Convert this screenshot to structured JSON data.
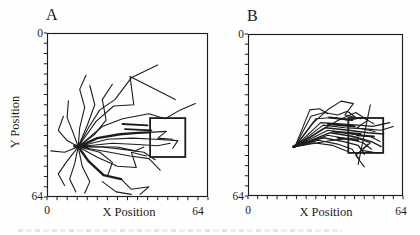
{
  "colors": {
    "ink": "#1c1c1c",
    "paper": "#fefefe"
  },
  "chart_data": [
    {
      "type": "line",
      "panel_label": "A",
      "xlabel": "X Position",
      "ylabel": "Y Position",
      "xlim": [
        0,
        64
      ],
      "ylim": [
        0,
        64
      ],
      "y_axis_inverted_downward": true,
      "tick_step": 4,
      "tick_labels_x": [
        "0",
        "64"
      ],
      "tick_labels_y": [
        "0",
        "64"
      ],
      "grid": false,
      "platform_square": {
        "x": 41,
        "y": 33.2,
        "w": 14,
        "h": 15.2
      },
      "hub_point": [
        12.4,
        44.4
      ],
      "trajectories": [
        {
          "pts": [
            [
              12.4,
              44.4
            ],
            [
              16.5,
              37
            ],
            [
              21,
              30
            ],
            [
              27,
              26
            ],
            [
              33.5,
              17.5
            ],
            [
              44,
              12.5
            ]
          ]
        },
        {
          "pts": [
            [
              12.4,
              44.4
            ],
            [
              19.5,
              34.5
            ],
            [
              26.5,
              28.5
            ],
            [
              34.5,
              28
            ],
            [
              33,
              17
            ],
            [
              51,
              26
            ]
          ]
        },
        {
          "pts": [
            [
              12.4,
              44.4
            ],
            [
              22,
              36.5
            ],
            [
              30,
              33.5
            ],
            [
              40.5,
              31.5
            ],
            [
              47,
              33.5
            ],
            [
              53,
              30
            ],
            [
              59,
              27.5
            ]
          ]
        },
        {
          "w": 2.4,
          "pts": [
            [
              12.4,
              44.4
            ],
            [
              20,
              41
            ],
            [
              29,
              39.5
            ],
            [
              36,
              39
            ],
            [
              40.5,
              38.8
            ]
          ]
        },
        {
          "pts": [
            [
              40.5,
              38.8
            ],
            [
              47.5,
              38.4
            ],
            [
              44,
              41
            ],
            [
              50,
              41.5
            ]
          ]
        },
        {
          "w": 1.8,
          "pts": [
            [
              30,
              35.5
            ],
            [
              40,
              36
            ]
          ]
        },
        {
          "w": 1.8,
          "pts": [
            [
              31,
              37.5
            ],
            [
              41.5,
              38
            ]
          ]
        },
        {
          "pts": [
            [
              12.4,
              44.4
            ],
            [
              24,
              41.5
            ],
            [
              34,
              41
            ],
            [
              43,
              41.5
            ],
            [
              52,
              42
            ],
            [
              50,
              45
            ]
          ]
        },
        {
          "pts": [
            [
              12.4,
              44.4
            ],
            [
              26,
              43
            ],
            [
              36,
              43.5
            ],
            [
              44,
              44
            ],
            [
              49,
              43
            ]
          ]
        },
        {
          "pts": [
            [
              12.4,
              44.4
            ],
            [
              28,
              44.5
            ],
            [
              35,
              46
            ],
            [
              38.5,
              44.5
            ]
          ]
        },
        {
          "pts": [
            [
              12.4,
              44.4
            ],
            [
              22,
              44.5
            ],
            [
              31,
              45.5
            ],
            [
              38.5,
              46.5
            ],
            [
              43,
              49.5
            ]
          ]
        },
        {
          "pts": [
            [
              12.4,
              44.4
            ],
            [
              25,
              46.5
            ],
            [
              33,
              48
            ],
            [
              40.5,
              49
            ],
            [
              45,
              53.5
            ]
          ]
        },
        {
          "pts": [
            [
              12.4,
              44.4
            ],
            [
              20,
              48.5
            ],
            [
              28,
              52
            ],
            [
              35.5,
              52.5
            ],
            [
              33.5,
              46.5
            ],
            [
              39.5,
              48
            ]
          ]
        },
        {
          "w": 2.4,
          "pts": [
            [
              12.4,
              44.4
            ],
            [
              16.5,
              50
            ],
            [
              22.5,
              55.5
            ],
            [
              29.5,
              57
            ]
          ]
        },
        {
          "pts": [
            [
              29.5,
              57
            ],
            [
              33.5,
              61
            ],
            [
              40.5,
              60
            ],
            [
              37,
              63
            ]
          ]
        },
        {
          "pts": [
            [
              12.4,
              44.4
            ],
            [
              14,
              52
            ],
            [
              17,
              58
            ],
            [
              15,
              62.5
            ]
          ]
        },
        {
          "pts": [
            [
              12.4,
              44.4
            ],
            [
              11,
              51
            ],
            [
              9,
              57
            ],
            [
              11.5,
              62
            ]
          ]
        },
        {
          "pts": [
            [
              12.4,
              44.4
            ],
            [
              8,
              50
            ],
            [
              4.5,
              55
            ],
            [
              7,
              59.5
            ]
          ]
        },
        {
          "pts": [
            [
              12.4,
              44.4
            ],
            [
              7,
              46.5
            ],
            [
              1.5,
              46
            ]
          ]
        },
        {
          "pts": [
            [
              12.4,
              44.4
            ],
            [
              8,
              42
            ],
            [
              4.5,
              38
            ],
            [
              6.5,
              32.5
            ]
          ]
        },
        {
          "pts": [
            [
              12.4,
              44.4
            ],
            [
              10,
              38
            ],
            [
              8,
              33
            ],
            [
              8.5,
              26.5
            ]
          ]
        },
        {
          "pts": [
            [
              12.4,
              44.4
            ],
            [
              13,
              37
            ],
            [
              15,
              29
            ],
            [
              13,
              22
            ],
            [
              15.5,
              16.5
            ]
          ]
        },
        {
          "pts": [
            [
              12.4,
              44.4
            ],
            [
              16,
              36
            ],
            [
              19,
              28
            ],
            [
              17,
              20.5
            ]
          ]
        },
        {
          "pts": [
            [
              12.4,
              44.4
            ],
            [
              19,
              39.5
            ],
            [
              23.5,
              34
            ],
            [
              22,
              26
            ],
            [
              26,
              20
            ]
          ]
        },
        {
          "pts": [
            [
              12.4,
              44.4
            ],
            [
              21,
              46.5
            ],
            [
              26,
              50.5
            ],
            [
              24,
              56
            ]
          ]
        },
        {
          "pts": [
            [
              22,
              58
            ],
            [
              27.5,
              62
            ],
            [
              33.5,
              63
            ]
          ]
        },
        {
          "w": 3,
          "pts": [
            [
              11,
              44.2
            ],
            [
              16,
              44.3
            ]
          ]
        }
      ]
    },
    {
      "type": "line",
      "panel_label": "B",
      "xlabel": "X Position",
      "ylabel": "",
      "xlim": [
        0,
        64
      ],
      "ylim": [
        0,
        64
      ],
      "y_axis_inverted_downward": true,
      "tick_step": 4,
      "tick_labels_x": [
        "0",
        "64"
      ],
      "tick_labels_y": [
        "0",
        "64"
      ],
      "grid": false,
      "platform_square": {
        "x": 41.4,
        "y": 33.2,
        "w": 14.4,
        "h": 13.8
      },
      "hub_point": [
        19.4,
        44.5
      ],
      "trajectories": [
        {
          "pts": [
            [
              19.4,
              44.5
            ],
            [
              23,
              36
            ],
            [
              25.5,
              30
            ],
            [
              29.5,
              29.5
            ],
            [
              33,
              31.5
            ]
          ]
        },
        {
          "pts": [
            [
              19.4,
              44.5
            ],
            [
              26,
              32.5
            ],
            [
              31.5,
              31
            ],
            [
              37,
              32
            ],
            [
              41,
              30.5
            ],
            [
              44.5,
              33
            ]
          ]
        },
        {
          "pts": [
            [
              19.4,
              44.5
            ],
            [
              28,
              33.5
            ],
            [
              35,
              33
            ],
            [
              41.5,
              34
            ],
            [
              47.5,
              33
            ],
            [
              52,
              35.5
            ]
          ]
        },
        {
          "pts": [
            [
              19.4,
              44.5
            ],
            [
              30,
              35
            ],
            [
              38,
              35.5
            ],
            [
              45.5,
              36
            ],
            [
              51.5,
              36.5
            ],
            [
              58.5,
              35
            ]
          ]
        },
        {
          "pts": [
            [
              19.4,
              44.5
            ],
            [
              31,
              36
            ],
            [
              40,
              37
            ],
            [
              48.5,
              37.5
            ],
            [
              55,
              38
            ],
            [
              60,
              36.5
            ]
          ]
        },
        {
          "w": 1.4,
          "pts": [
            [
              19.4,
              44.5
            ],
            [
              32,
              37
            ],
            [
              41.5,
              38
            ],
            [
              49.5,
              39
            ],
            [
              56,
              39.5
            ]
          ]
        },
        {
          "pts": [
            [
              19.4,
              44.5
            ],
            [
              33,
              38
            ],
            [
              42.5,
              39.5
            ],
            [
              50.5,
              40.5
            ],
            [
              54.5,
              42.5
            ]
          ]
        },
        {
          "w": 1.4,
          "pts": [
            [
              19.4,
              44.5
            ],
            [
              34,
              39
            ],
            [
              43.5,
              40.5
            ],
            [
              51,
              42.5
            ],
            [
              55,
              44.5
            ]
          ]
        },
        {
          "pts": [
            [
              19.4,
              44.5
            ],
            [
              33,
              40
            ],
            [
              41.5,
              41.5
            ],
            [
              47.5,
              43
            ],
            [
              51,
              45.5
            ]
          ]
        },
        {
          "w": 1.4,
          "pts": [
            [
              19.4,
              44.5
            ],
            [
              31,
              41
            ],
            [
              39.5,
              42.5
            ],
            [
              45.5,
              44
            ],
            [
              48,
              47.5
            ]
          ]
        },
        {
          "pts": [
            [
              19.4,
              44.5
            ],
            [
              29,
              42
            ],
            [
              37,
              43.5
            ],
            [
              43,
              45.5
            ],
            [
              46,
              49.5
            ]
          ]
        },
        {
          "pts": [
            [
              19.4,
              44.5
            ],
            [
              27,
              43
            ],
            [
              35,
              44
            ],
            [
              41.5,
              46.5
            ]
          ]
        },
        {
          "pts": [
            [
              19.4,
              44.5
            ],
            [
              27,
              35
            ],
            [
              33.5,
              29.5
            ],
            [
              38.5,
              26.5
            ],
            [
              43.5,
              27.5
            ],
            [
              40,
              32
            ],
            [
              46.5,
              33.5
            ]
          ]
        },
        {
          "pts": [
            [
              19.4,
              44.5
            ],
            [
              30,
              38
            ],
            [
              37.5,
              34
            ],
            [
              44.5,
              31
            ],
            [
              49.5,
              34
            ],
            [
              45,
              37
            ],
            [
              52.5,
              38.5
            ]
          ]
        },
        {
          "pts": [
            [
              19.4,
              44.5
            ],
            [
              35,
              42
            ],
            [
              44.5,
              41
            ],
            [
              50.5,
              43
            ],
            [
              47,
              46
            ],
            [
              53.5,
              47
            ]
          ]
        },
        {
          "pts": [
            [
              50.5,
              28
            ],
            [
              45.5,
              51.5
            ]
          ]
        },
        {
          "pts": [
            [
              49.5,
              43.5
            ],
            [
              44.5,
              48
            ],
            [
              48,
              52.5
            ]
          ]
        },
        {
          "w": 2.2,
          "pts": [
            [
              33,
              35.5
            ],
            [
              44,
              36.5
            ]
          ]
        },
        {
          "w": 2.2,
          "pts": [
            [
              35,
              38.5
            ],
            [
              46.5,
              39.5
            ]
          ]
        },
        {
          "w": 2,
          "pts": [
            [
              37,
              41
            ],
            [
              45.5,
              42
            ]
          ]
        },
        {
          "w": 2,
          "pts": [
            [
              33.5,
              33
            ],
            [
              43,
              34
            ]
          ]
        },
        {
          "w": 2,
          "pts": [
            [
              45,
              40
            ],
            [
              52,
              40.5
            ]
          ]
        },
        {
          "w": 3,
          "pts": [
            [
              18.8,
              44.5
            ],
            [
              24,
              42.5
            ]
          ]
        }
      ]
    }
  ]
}
